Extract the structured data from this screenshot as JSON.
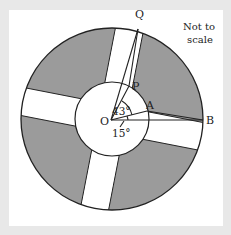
{
  "diagram": {
    "title_note": [
      "Not to",
      "scale"
    ],
    "points": {
      "O": "O",
      "A": "A",
      "B": "B",
      "P": "P",
      "Q": "Q"
    },
    "angles": {
      "angle_AOP": "43°",
      "angle_AOB": "15°"
    },
    "colors": {
      "background": "#e8e8e8",
      "panel": "#ffffff",
      "shaded": "#9b9b9b",
      "stroke": "#222222"
    }
  }
}
